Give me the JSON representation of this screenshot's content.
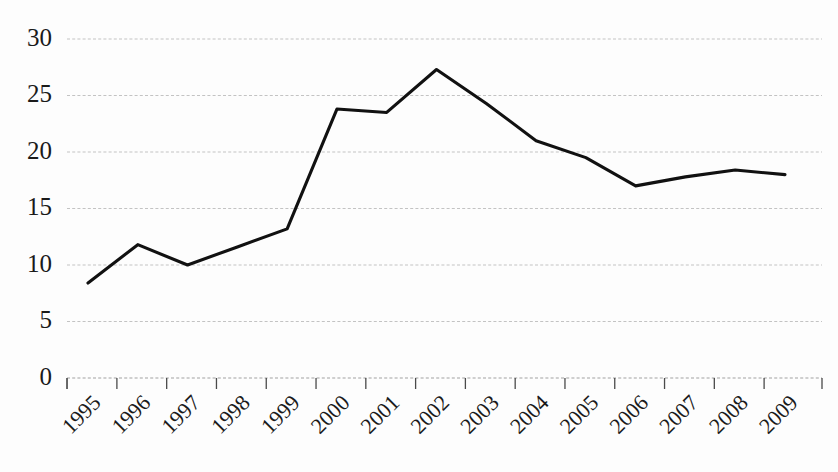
{
  "chart_data": {
    "type": "line",
    "title": "",
    "subtitle": "",
    "xlabel": "",
    "ylabel": "",
    "categories": [
      "1995",
      "1996",
      "1997",
      "1998",
      "1999",
      "2000",
      "2001",
      "2002",
      "2003",
      "2004",
      "2005",
      "2006",
      "2007",
      "2008",
      "2009"
    ],
    "values": [
      8.4,
      11.8,
      10.0,
      11.6,
      13.2,
      23.8,
      23.5,
      27.3,
      24.3,
      21.0,
      19.5,
      17.0,
      17.8,
      18.4,
      18.0
    ],
    "series": [
      {
        "name": "",
        "values": [
          8.4,
          11.8,
          10.0,
          11.6,
          13.2,
          23.8,
          23.5,
          27.3,
          24.3,
          21.0,
          19.5,
          17.0,
          17.8,
          18.4,
          18.0
        ]
      }
    ],
    "ylim": [
      0,
      30
    ],
    "yticks": [
      0,
      5,
      10,
      15,
      20,
      25,
      30
    ],
    "ytick_labels": [
      "0",
      "5",
      "10",
      "15",
      "20",
      "25",
      "30"
    ],
    "xtick_labels": [
      "1995",
      "1996",
      "1997",
      "1998",
      "1999",
      "2000",
      "2001",
      "2002",
      "2003",
      "2004",
      "2005",
      "2006",
      "2007",
      "2008",
      "2009"
    ],
    "xtick_rotation_deg": -45,
    "grid": true,
    "grid_axis": "y",
    "legend": false,
    "legend_position": "none",
    "annotations": [],
    "colors": {
      "line": "#111111",
      "grid": "#b9b9b9",
      "axis": "#4a4a4a",
      "text": "#1a1a1a",
      "background": "#fdfdfd"
    },
    "markers": false,
    "line_width": 3.1
  }
}
